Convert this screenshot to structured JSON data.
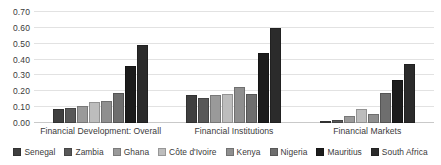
{
  "chart_data": {
    "type": "bar",
    "title": "",
    "subtitle": "",
    "xlabel": "",
    "ylabel": "",
    "categories": [
      "Financial Development: Overall",
      "Financial Institutions",
      "Financial Markets"
    ],
    "series": [
      {
        "name": "Senegal",
        "color": "#3f3f3f",
        "values": [
          0.09,
          0.175,
          0.005
        ]
      },
      {
        "name": "Zambia",
        "color": "#585858",
        "values": [
          0.095,
          0.16,
          0.02
        ]
      },
      {
        "name": "Ghana",
        "color": "#9a9a9a",
        "values": [
          0.11,
          0.175,
          0.045
        ]
      },
      {
        "name": "Côte d'Ivoire",
        "color": "#bdbdbd",
        "values": [
          0.135,
          0.18,
          0.09
        ]
      },
      {
        "name": "Kenya",
        "color": "#8f8f8f",
        "values": [
          0.14,
          0.225,
          0.055
        ]
      },
      {
        "name": "Nigeria",
        "color": "#6e6e6e",
        "values": [
          0.19,
          0.185,
          0.19
        ]
      },
      {
        "name": "Mauritius",
        "color": "#1c1c1c",
        "values": [
          0.36,
          0.44,
          0.27
        ]
      },
      {
        "name": "South Africa",
        "color": "#2b2b2b",
        "values": [
          0.49,
          0.6,
          0.37
        ]
      }
    ],
    "ylim": [
      0.0,
      0.7
    ],
    "ytick_step": 0.1,
    "ytick_labels": [
      "0.00",
      "0.10",
      "0.20",
      "0.30",
      "0.40",
      "0.50",
      "0.60",
      "0.70"
    ],
    "ytick_values": [
      0.0,
      0.1,
      0.2,
      0.3,
      0.4,
      0.5,
      0.6,
      0.7
    ],
    "grid": true,
    "legend_position": "bottom"
  },
  "colors": {
    "background": "#ffffff",
    "gridline": "#e2e2e2",
    "axis": "#c9c9c9",
    "text": "#3a3a3a"
  }
}
